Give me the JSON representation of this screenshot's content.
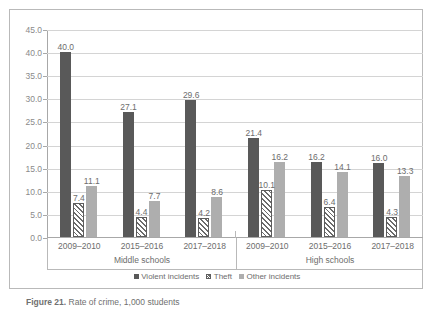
{
  "chart_data": {
    "type": "bar",
    "title": "",
    "xlabel": "",
    "ylabel": "",
    "ylim": [
      0.0,
      45.0
    ],
    "ytick_step": 5.0,
    "grid": true,
    "legend_position": "bottom",
    "ytick_labels": [
      "45.0",
      "40.0",
      "35.0",
      "30.0",
      "25.0",
      "20.0",
      "15.0",
      "10.0",
      "5.0",
      "0.0"
    ],
    "ytick_values": [
      45.0,
      40.0,
      35.0,
      30.0,
      25.0,
      20.0,
      15.0,
      10.0,
      5.0,
      0.0
    ],
    "groups": [
      {
        "name": "Middle schools",
        "categories": [
          "2009–2010",
          "2015–2016",
          "2017–2018"
        ]
      },
      {
        "name": "High schools",
        "categories": [
          "2009–2010",
          "2015–2016",
          "2017–2018"
        ]
      }
    ],
    "categories": [
      "2009–2010",
      "2015–2016",
      "2017–2018",
      "2009–2010",
      "2015–2016",
      "2017–2018"
    ],
    "series": [
      {
        "name": "Violent incidents",
        "color": "#595959",
        "pattern": "solid",
        "values": [
          40.0,
          27.1,
          29.6,
          21.4,
          16.2,
          16.0
        ],
        "labels": [
          "40.0",
          "27.1",
          "29.6",
          "21.4",
          "16.2",
          "16.0"
        ]
      },
      {
        "name": "Theft",
        "color": "#ffffff",
        "pattern": "diagonal-hatch",
        "values": [
          7.4,
          4.4,
          4.2,
          10.1,
          6.4,
          4.3
        ],
        "labels": [
          "7.4",
          "4.4",
          "4.2",
          "10.1",
          "6.4",
          "4.3"
        ]
      },
      {
        "name": "Other incidents",
        "color": "#aeaeae",
        "pattern": "solid",
        "values": [
          11.1,
          7.7,
          8.6,
          16.2,
          14.1,
          13.3
        ],
        "labels": [
          "11.1",
          "7.7",
          "8.6",
          "16.2",
          "14.1",
          "13.3"
        ]
      }
    ]
  },
  "legend": {
    "items": [
      {
        "label": "Violent incidents",
        "swatch": "violent"
      },
      {
        "label": "Theft",
        "swatch": "theft"
      },
      {
        "label": "Other incidents",
        "swatch": "other"
      }
    ]
  },
  "caption": {
    "figure_number": "Figure 21.",
    "text": "Rate of crime, 1,000 students"
  },
  "colors": {
    "violent": "#595959",
    "theft": "#ffffff",
    "other": "#aeaeae",
    "gridline": "#d4d4d4",
    "axis": "#a8a8a8",
    "frame": "#b9b9b9",
    "text": "#6d6d6d"
  }
}
